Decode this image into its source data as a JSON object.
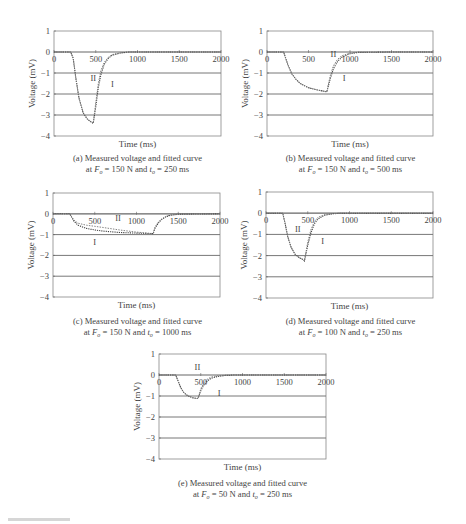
{
  "figure": {
    "panels": [
      {
        "id": "a",
        "caption_line1": "(a) Measured voltage and fitted curve",
        "caption_pre": "at ",
        "F": "150",
        "t": "250"
      },
      {
        "id": "b",
        "caption_line1": "(b) Measured voltage and fitted curve",
        "caption_pre": "at ",
        "F": "150",
        "t": "500"
      },
      {
        "id": "c",
        "caption_line1": "(c) Measured voltage and fitted curve",
        "caption_pre": "at ",
        "F": "150",
        "t": "1000"
      },
      {
        "id": "d",
        "caption_line1": "(d) Measured voltage and fitted curve",
        "caption_pre": "at ",
        "F": "100",
        "t": "250"
      },
      {
        "id": "e",
        "caption_line1": "(e) Measured voltage and fitted curve",
        "caption_pre": "at ",
        "F": "50",
        "t": "250"
      }
    ],
    "units": {
      "force": "N",
      "time": "ms"
    },
    "colors": {
      "axis": "#555555",
      "grid": "#555555",
      "measured": "#444444",
      "fitted": "#777777",
      "text": "#444444"
    }
  },
  "chart_data": [
    {
      "type": "line",
      "panel": "a",
      "title": "(a) Measured voltage and fitted curve at F_o = 150 N and t_o = 250 ms",
      "xlabel": "Time (ms)",
      "ylabel": "Voltage (mV)",
      "xlim": [
        0,
        2000
      ],
      "ylim": [
        -4,
        1
      ],
      "xticks": [
        0,
        500,
        1000,
        1500,
        2000
      ],
      "yticks": [
        1,
        0,
        -1,
        -2,
        -3,
        -4
      ],
      "grid": "horizontal",
      "annotations": [
        {
          "text": "II",
          "x": 470,
          "y": -1.25
        },
        {
          "text": "I",
          "x": 700,
          "y": -1.5
        }
      ],
      "series": [
        {
          "name": "I (measured)",
          "x": [
            0,
            200,
            230,
            260,
            300,
            350,
            400,
            450,
            470,
            500,
            530,
            560,
            600,
            650,
            700,
            800,
            900,
            1000,
            1500,
            2000
          ],
          "y": [
            0,
            0,
            -0.3,
            -1.2,
            -2.2,
            -2.9,
            -3.2,
            -3.35,
            -3.4,
            -2.6,
            -1.7,
            -1.1,
            -0.6,
            -0.3,
            -0.15,
            -0.05,
            0,
            0,
            0,
            0
          ]
        },
        {
          "name": "II (fitted)",
          "x": [
            0,
            200,
            230,
            260,
            300,
            350,
            400,
            450,
            470,
            500,
            530,
            560,
            600,
            650,
            700,
            800,
            900,
            1000,
            1500,
            2000
          ],
          "y": [
            0,
            0,
            -0.3,
            -1.2,
            -2.2,
            -2.9,
            -3.2,
            -3.35,
            -3.4,
            -2.4,
            -1.5,
            -0.9,
            -0.5,
            -0.25,
            -0.12,
            -0.04,
            0,
            0,
            0,
            0
          ]
        }
      ]
    },
    {
      "type": "line",
      "panel": "b",
      "title": "(b) Measured voltage and fitted curve at F_o = 150 N and t_o = 500 ms",
      "xlabel": "Time (ms)",
      "ylabel": "Voltage (mV)",
      "xlim": [
        0,
        2000
      ],
      "ylim": [
        -4,
        1
      ],
      "xticks": [
        0,
        500,
        1000,
        1500,
        2000
      ],
      "yticks": [
        1,
        0,
        -1,
        -2,
        -3,
        -4
      ],
      "grid": "horizontal",
      "annotations": [
        {
          "text": "II",
          "x": 800,
          "y": -0.1
        },
        {
          "text": "I",
          "x": 930,
          "y": -1.25
        }
      ],
      "series": [
        {
          "name": "I (measured)",
          "x": [
            0,
            200,
            250,
            300,
            350,
            400,
            500,
            600,
            700,
            720,
            760,
            800,
            850,
            900,
            1000,
            1100,
            1500,
            2000
          ],
          "y": [
            0,
            0,
            -0.6,
            -1.05,
            -1.3,
            -1.5,
            -1.7,
            -1.8,
            -1.88,
            -1.9,
            -1.3,
            -0.8,
            -0.45,
            -0.25,
            -0.08,
            -0.02,
            0,
            0
          ]
        },
        {
          "name": "II (fitted)",
          "x": [
            0,
            200,
            250,
            300,
            350,
            400,
            500,
            600,
            700,
            720,
            760,
            800,
            850,
            900,
            1000,
            1100,
            1500,
            2000
          ],
          "y": [
            0,
            0,
            -0.6,
            -1.05,
            -1.3,
            -1.5,
            -1.7,
            -1.8,
            -1.88,
            -1.9,
            -1.15,
            -0.65,
            -0.35,
            -0.18,
            -0.05,
            -0.01,
            0,
            0
          ]
        }
      ]
    },
    {
      "type": "line",
      "panel": "c",
      "title": "(c) Measured voltage and fitted curve at F_o = 150 N and t_o = 1000 ms",
      "xlabel": "Time (ms)",
      "ylabel": "Voltage (mV)",
      "xlim": [
        0,
        2000
      ],
      "ylim": [
        -4,
        1
      ],
      "xticks": [
        0,
        500,
        1000,
        1500,
        2000
      ],
      "yticks": [
        1,
        0,
        -1,
        -2,
        -3,
        -4
      ],
      "grid": "horizontal",
      "annotations": [
        {
          "text": "II",
          "x": 780,
          "y": -0.2
        },
        {
          "text": "I",
          "x": 500,
          "y": -1.35
        }
      ],
      "series": [
        {
          "name": "I (measured)",
          "x": [
            0,
            200,
            250,
            300,
            400,
            500,
            600,
            800,
            1000,
            1200,
            1220,
            1260,
            1300,
            1350,
            1400,
            1500,
            2000
          ],
          "y": [
            0,
            0,
            -0.35,
            -0.55,
            -0.7,
            -0.78,
            -0.83,
            -0.9,
            -0.93,
            -0.95,
            -0.7,
            -0.45,
            -0.28,
            -0.15,
            -0.08,
            -0.02,
            0
          ]
        },
        {
          "name": "II (fitted)",
          "x": [
            0,
            200,
            250,
            300,
            400,
            500,
            600,
            800,
            1000,
            1200,
            1220,
            1260,
            1300,
            1350,
            1400,
            1500,
            2000
          ],
          "y": [
            0,
            0,
            -0.3,
            -0.45,
            -0.55,
            -0.6,
            -0.66,
            -0.78,
            -0.88,
            -0.95,
            -0.65,
            -0.4,
            -0.25,
            -0.13,
            -0.06,
            -0.01,
            0
          ]
        }
      ]
    },
    {
      "type": "line",
      "panel": "d",
      "title": "(d) Measured voltage and fitted curve at F_o = 100 N and t_o = 250 ms",
      "xlabel": "Time (ms)",
      "ylabel": "Voltage (mV)",
      "xlim": [
        0,
        2000
      ],
      "ylim": [
        -4,
        1
      ],
      "xticks": [
        0,
        500,
        1000,
        1500,
        2000
      ],
      "yticks": [
        1,
        0,
        -1,
        -2,
        -3,
        -4
      ],
      "grid": "horizontal",
      "annotations": [
        {
          "text": "II",
          "x": 380,
          "y": -0.75
        },
        {
          "text": "I",
          "x": 680,
          "y": -1.3
        }
      ],
      "series": [
        {
          "name": "I (measured)",
          "x": [
            0,
            200,
            230,
            260,
            300,
            350,
            400,
            450,
            460,
            500,
            540,
            580,
            620,
            700,
            800,
            900,
            1500,
            2000
          ],
          "y": [
            0,
            0,
            -0.5,
            -1.1,
            -1.6,
            -1.95,
            -2.1,
            -2.2,
            -2.25,
            -1.5,
            -0.9,
            -0.5,
            -0.28,
            -0.1,
            -0.03,
            0,
            0,
            0
          ]
        },
        {
          "name": "II (fitted)",
          "x": [
            0,
            200,
            230,
            260,
            300,
            350,
            400,
            450,
            460,
            500,
            540,
            580,
            620,
            700,
            800,
            900,
            1500,
            2000
          ],
          "y": [
            0,
            0,
            -0.5,
            -1.1,
            -1.6,
            -1.95,
            -2.1,
            -2.2,
            -2.25,
            -1.35,
            -0.75,
            -0.4,
            -0.2,
            -0.07,
            -0.02,
            0,
            0,
            0
          ]
        }
      ]
    },
    {
      "type": "line",
      "panel": "e",
      "title": "(e) Measured voltage and fitted curve at F_o = 50 N and t_o = 250 ms",
      "xlabel": "Time (ms)",
      "ylabel": "Voltage (mV)",
      "xlim": [
        0,
        2000
      ],
      "ylim": [
        -4,
        1
      ],
      "xticks": [
        0,
        500,
        1000,
        1500,
        2000
      ],
      "yticks": [
        1,
        0,
        -1,
        -2,
        -3,
        -4
      ],
      "grid": "horizontal",
      "annotations": [
        {
          "text": "II",
          "x": 460,
          "y": 0.4
        },
        {
          "text": "I",
          "x": 720,
          "y": -0.85
        }
      ],
      "series": [
        {
          "name": "I (measured)",
          "x": [
            0,
            200,
            230,
            260,
            300,
            350,
            400,
            450,
            470,
            500,
            540,
            580,
            620,
            700,
            800,
            900,
            1500,
            2000
          ],
          "y": [
            0,
            0,
            -0.3,
            -0.6,
            -0.85,
            -1.0,
            -1.08,
            -1.12,
            -1.1,
            -0.75,
            -0.45,
            -0.28,
            -0.16,
            -0.07,
            -0.02,
            0,
            0,
            0
          ]
        },
        {
          "name": "II (fitted)",
          "x": [
            0,
            200,
            230,
            260,
            300,
            350,
            400,
            450,
            470,
            500,
            540,
            580,
            620,
            700,
            800,
            900,
            1500,
            2000
          ],
          "y": [
            0,
            0,
            -0.3,
            -0.6,
            -0.85,
            -1.0,
            -1.08,
            -1.12,
            -1.1,
            -0.65,
            -0.35,
            -0.2,
            -0.1,
            -0.04,
            -0.01,
            0,
            0,
            0
          ]
        }
      ]
    }
  ]
}
